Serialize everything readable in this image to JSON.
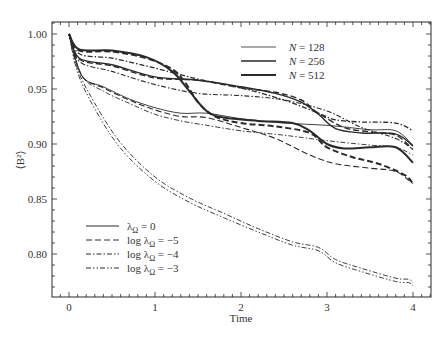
{
  "chart_data": {
    "type": "line",
    "title": "",
    "xlabel": "Time",
    "ylabel": "⟨B²⟩",
    "xlim": [
      -0.3,
      4.2
    ],
    "ylim": [
      0.76,
      1.011
    ],
    "xticks": [
      0,
      1,
      2,
      3,
      4
    ],
    "xtick_labels": [
      "0",
      "1",
      "2",
      "3",
      "4"
    ],
    "yticks": [
      0.8,
      0.85,
      0.9,
      0.95,
      1.0
    ],
    "ytick_labels": [
      "0.80",
      "0.85",
      "0.90",
      "0.95",
      "1.00"
    ],
    "grid": false,
    "legend_resolution": {
      "position": "upper right",
      "entries": [
        {
          "label_var": "N",
          "label_val": "= 128",
          "width": 0.8
        },
        {
          "label_var": "N",
          "label_val": "= 256",
          "width": 1.4
        },
        {
          "label_var": "N",
          "label_val": "= 512",
          "width": 2.0
        }
      ]
    },
    "legend_lambda": {
      "position": "lower left",
      "entries": [
        {
          "prefix": "",
          "sym": "λ",
          "sub": "Ω",
          "suffix": " = 0",
          "dash": ""
        },
        {
          "prefix": "log ",
          "sym": "λ",
          "sub": "Ω",
          "suffix": " = −5",
          "dash": "6,3"
        },
        {
          "prefix": "log ",
          "sym": "λ",
          "sub": "Ω",
          "suffix": " = −4",
          "dash": "5,2,1.5,2"
        },
        {
          "prefix": "log ",
          "sym": "λ",
          "sub": "Ω",
          "suffix": " = −3",
          "dash": "5,2,1.5,2,1.5,2"
        }
      ]
    },
    "series": [
      {
        "name": "N=512, λΩ=0",
        "width": 2.0,
        "dash": "",
        "x": [
          0,
          0.12,
          0.5,
          0.9,
          1.2,
          1.4,
          1.6,
          1.8,
          2.2,
          2.6,
          2.8,
          3.0,
          3.2,
          3.5,
          3.8,
          4.0
        ],
        "y": [
          1.0,
          0.986,
          0.985,
          0.979,
          0.966,
          0.948,
          0.93,
          0.924,
          0.921,
          0.919,
          0.912,
          0.9,
          0.896,
          0.897,
          0.897,
          0.883
        ]
      },
      {
        "name": "N=512, log λΩ=-5",
        "width": 2.0,
        "dash": "6,3",
        "x": [
          0,
          0.12,
          0.5,
          0.9,
          1.2,
          1.35,
          1.5,
          1.7,
          2.0,
          2.4,
          2.8,
          3.0,
          3.3,
          3.6,
          3.9,
          4.0
        ],
        "y": [
          1.0,
          0.985,
          0.984,
          0.978,
          0.968,
          0.956,
          0.938,
          0.925,
          0.919,
          0.916,
          0.91,
          0.897,
          0.888,
          0.882,
          0.872,
          0.864
        ]
      },
      {
        "name": "N=512, log λΩ=-4",
        "width": 1.3,
        "dash": "5,2,1.5,2",
        "x": [
          0,
          0.12,
          0.5,
          1.0,
          1.5,
          2.0,
          2.5,
          2.9,
          3.1,
          3.4,
          3.8,
          4.0
        ],
        "y": [
          1.0,
          0.982,
          0.978,
          0.969,
          0.959,
          0.951,
          0.94,
          0.928,
          0.922,
          0.92,
          0.919,
          0.912
        ]
      },
      {
        "name": "N=256, λΩ=0",
        "width": 1.4,
        "dash": "",
        "x": [
          0,
          0.12,
          0.5,
          1.0,
          1.5,
          2.0,
          2.4,
          2.7,
          2.9,
          3.1,
          3.4,
          3.8,
          4.0
        ],
        "y": [
          1.0,
          0.978,
          0.972,
          0.961,
          0.958,
          0.952,
          0.946,
          0.938,
          0.927,
          0.914,
          0.91,
          0.909,
          0.898
        ]
      },
      {
        "name": "N=256, log λΩ=-5",
        "width": 1.4,
        "dash": "6,3",
        "x": [
          0,
          0.12,
          0.5,
          1.0,
          1.5,
          2.0,
          2.4,
          2.7,
          2.9,
          3.2,
          3.5,
          3.8,
          4.0
        ],
        "y": [
          1.0,
          0.977,
          0.971,
          0.96,
          0.958,
          0.951,
          0.947,
          0.94,
          0.928,
          0.915,
          0.911,
          0.908,
          0.895
        ]
      },
      {
        "name": "N=256, log λΩ=-4",
        "width": 1.1,
        "dash": "5,2,1.5,2",
        "x": [
          0,
          0.12,
          0.5,
          1.0,
          1.5,
          2.0,
          2.5,
          3.0,
          3.4,
          3.8,
          4.0
        ],
        "y": [
          1.0,
          0.975,
          0.966,
          0.954,
          0.946,
          0.944,
          0.94,
          0.93,
          0.915,
          0.905,
          0.895
        ]
      },
      {
        "name": "N=128, λΩ=0",
        "width": 0.9,
        "dash": "",
        "x": [
          0,
          0.15,
          0.4,
          0.7,
          1.0,
          1.3,
          1.6,
          2.0,
          2.5,
          3.0,
          3.5,
          3.8,
          4.0
        ],
        "y": [
          1.0,
          0.962,
          0.952,
          0.941,
          0.933,
          0.928,
          0.928,
          0.923,
          0.919,
          0.917,
          0.913,
          0.912,
          0.899
        ]
      },
      {
        "name": "N=128, log λΩ=-5",
        "width": 1.1,
        "dash": "6,3",
        "x": [
          0,
          0.15,
          0.4,
          0.7,
          1.0,
          1.3,
          1.6,
          2.0,
          2.4,
          2.8,
          3.1,
          3.5,
          3.8,
          4.0
        ],
        "y": [
          1.0,
          0.962,
          0.951,
          0.94,
          0.931,
          0.925,
          0.924,
          0.915,
          0.905,
          0.89,
          0.882,
          0.878,
          0.875,
          0.864
        ]
      },
      {
        "name": "N=128, log λΩ=-4 (lower group)",
        "width": 0.9,
        "dash": "5,2,1.5,2",
        "x": [
          0,
          0.15,
          0.4,
          0.7,
          1.0,
          1.3,
          1.6,
          2.0,
          2.5,
          3.0,
          3.5,
          3.8,
          4.0
        ],
        "y": [
          1.0,
          0.962,
          0.948,
          0.937,
          0.927,
          0.921,
          0.917,
          0.912,
          0.908,
          0.903,
          0.899,
          0.897,
          0.89
        ]
      },
      {
        "name": "N=128, log λΩ=-4",
        "width": 0.9,
        "dash": "5,2,1.5,2",
        "x": [
          0,
          0.1,
          0.3,
          0.6,
          1.0,
          1.4,
          1.8,
          2.2,
          2.6,
          2.9,
          3.1,
          3.4,
          3.8,
          3.95,
          4.0
        ],
        "y": [
          1.0,
          0.968,
          0.937,
          0.901,
          0.87,
          0.851,
          0.837,
          0.823,
          0.811,
          0.806,
          0.795,
          0.787,
          0.778,
          0.777,
          0.774
        ]
      },
      {
        "name": "N=128, log λΩ=-3",
        "width": 0.9,
        "dash": "5,2,1.5,2,1.5,2",
        "x": [
          0,
          0.1,
          0.3,
          0.6,
          1.0,
          1.4,
          1.8,
          2.2,
          2.6,
          2.9,
          3.1,
          3.4,
          3.8,
          3.95,
          4.0
        ],
        "y": [
          1.0,
          0.965,
          0.932,
          0.896,
          0.866,
          0.847,
          0.833,
          0.82,
          0.808,
          0.803,
          0.792,
          0.784,
          0.775,
          0.774,
          0.771
        ]
      }
    ]
  },
  "plot_area": {
    "left": 52,
    "top": 22,
    "right": 431,
    "bottom": 297
  }
}
